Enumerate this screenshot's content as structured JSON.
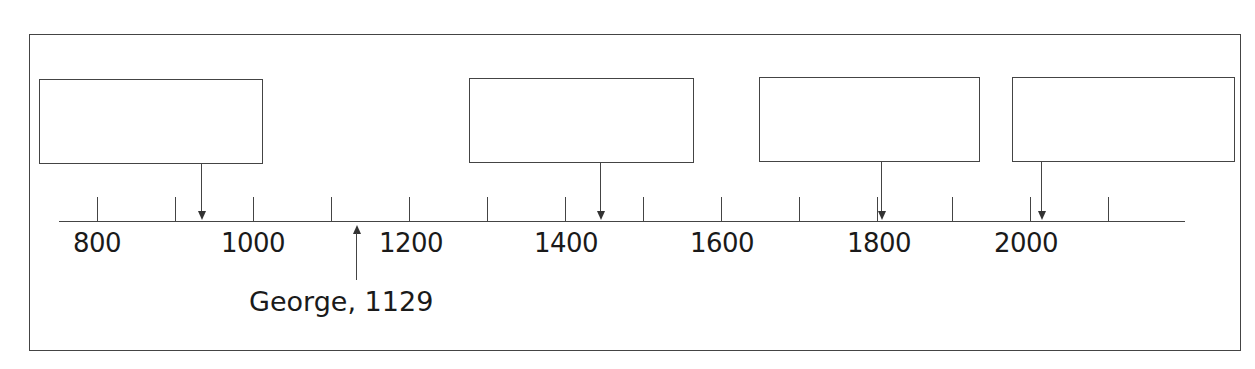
{
  "diagram": {
    "type": "timeline",
    "axis": {
      "labels": [
        "800",
        "1000",
        "1200",
        "1400",
        "1600",
        "1800",
        "2000"
      ],
      "tick_years": [
        800,
        900,
        1000,
        1100,
        1200,
        1300,
        1400,
        1500,
        1600,
        1700,
        1800,
        1900,
        2000,
        2100
      ],
      "range": [
        750,
        2200
      ]
    },
    "blank_boxes": [
      {
        "id": "box-1",
        "points_to_year_approx": 930,
        "text": ""
      },
      {
        "id": "box-2",
        "points_to_year_approx": 1440,
        "text": ""
      },
      {
        "id": "box-3",
        "points_to_year_approx": 1805,
        "text": ""
      },
      {
        "id": "box-4",
        "points_to_year_approx": 2010,
        "text": ""
      }
    ],
    "annotation": {
      "label": "George, 1129",
      "year": 1129
    }
  },
  "colors": {
    "line": "#444444",
    "text": "#1a1a1a",
    "background": "#ffffff"
  }
}
